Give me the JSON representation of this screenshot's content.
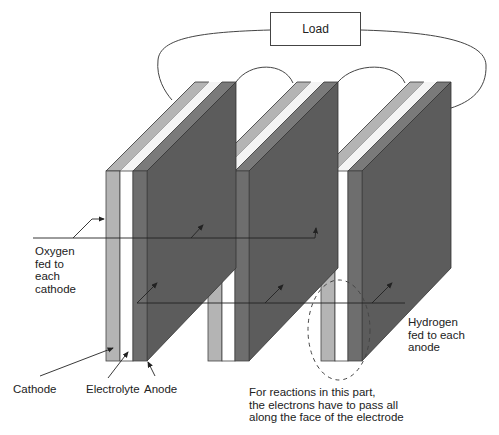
{
  "diagram": {
    "type": "fuel-cell-stack-series-connection",
    "load": {
      "label": "Load"
    },
    "cells": [
      {
        "id": 1,
        "front_x": 106
      },
      {
        "id": 2,
        "front_x": 208
      },
      {
        "id": 3,
        "front_x": 321
      }
    ],
    "layers": [
      "Cathode",
      "Electrolyte",
      "Anode"
    ],
    "labels": {
      "oxygen": "Oxygen\nfed to\neach\ncathode",
      "hydrogen": "Hydrogen\nfed to each\nanode",
      "cathode": "Cathode",
      "electrolyte": "Electrolyte",
      "anode": "Anode",
      "note": "For reactions in this part,\nthe electrons have to pass all\nalong the face of the electrode"
    },
    "colors": {
      "cathode": "#b4b4b4",
      "electrolyte": "#ffffff",
      "anode": "#6e6e6e",
      "side_face": "#5c5c5c",
      "outline": "#333333"
    }
  }
}
